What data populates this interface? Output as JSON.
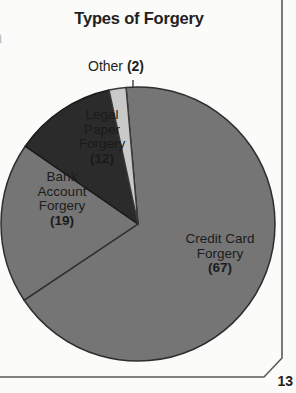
{
  "page": {
    "number": "13",
    "bleed_glyph": "n"
  },
  "chart_data": {
    "type": "pie",
    "title": "Types of Forgery",
    "xlabel": "",
    "ylabel": "",
    "total": 100,
    "units": "cases",
    "legend_position": "none",
    "labels_inside_slices": true,
    "categories": [
      "Credit Card Forgery",
      "Bank Account Forgery",
      "Legal Paper Forgery",
      "Other"
    ],
    "values": [
      67,
      19,
      12,
      2
    ],
    "slices": [
      {
        "name": "Credit Card Forgery",
        "label_line1": "Credit Card",
        "label_line2": "Forgery",
        "value": 67,
        "value_text": "(67)",
        "percent": 67,
        "color": "#757575",
        "stroke": "#2e2e2e",
        "start_angle": -5,
        "sweep_angle": 241.2,
        "label_placement": "inside"
      },
      {
        "name": "Bank Account Forgery",
        "label_line1": "Bank",
        "label_line2": "Account",
        "label_line3": "Forgery",
        "value": 19,
        "value_text": "(19)",
        "percent": 19,
        "color": "#757575",
        "stroke": "#2e2e2e",
        "start_angle": 236.2,
        "sweep_angle": 68.4,
        "label_placement": "inside"
      },
      {
        "name": "Legal Paper Forgery",
        "label_line1": "Legal",
        "label_line2": "Paper",
        "label_line3": "Forgery",
        "value": 12,
        "value_text": "(12)",
        "percent": 12,
        "color": "#2b2b2b",
        "stroke": "#1a1a1a",
        "start_angle": 304.6,
        "sweep_angle": 43.2,
        "label_placement": "inside"
      },
      {
        "name": "Other",
        "label_line1": "Other",
        "value": 2,
        "value_text": "(2)",
        "percent": 2,
        "color": "#c9c9c9",
        "stroke": "#3a3a3a",
        "start_angle": 347.8,
        "sweep_angle": 7.2,
        "label_placement": "callout"
      }
    ]
  }
}
